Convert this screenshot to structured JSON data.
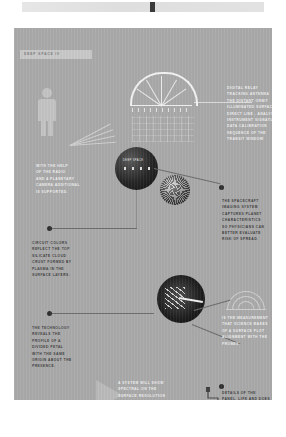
{
  "poster": {
    "background_color": "#a9a9a9",
    "header": {
      "label": "DEEP SPACE IV"
    },
    "top_strip": {
      "name": "film-strip",
      "marker_color": "#3a3a3a"
    }
  },
  "graphics": {
    "human_figure": {
      "name": "human-scale-figure"
    },
    "dome": {
      "name": "dome-arc-diagram"
    },
    "schematic": {
      "name": "grid-schematic"
    },
    "radar": {
      "name": "radar-dial-diagram"
    },
    "chevron": {
      "name": "chevron-marker"
    },
    "step_line": {
      "name": "stepped-connector-line"
    },
    "dark_bar": {
      "name": "dark-vertical-bar"
    }
  },
  "circles": [
    {
      "name": "planet-surface-photo",
      "caption": "DEEP SPACE",
      "size": "large"
    },
    {
      "name": "asteroid-photo",
      "caption": "",
      "size": "small"
    },
    {
      "name": "space-probe-photo",
      "caption": "",
      "size": "medium"
    }
  ],
  "text_blocks": {
    "right_1": {
      "name": "right-caption-one",
      "lines": [
        "DIGITAL RELAY",
        "TRACKING ANTENNA",
        "THE DISTANT ORBIT",
        "ILLUMINATED SURFACE",
        "DIRECT LINE - ANALYSIS",
        "INSTRUMENT SIGNATURE",
        "DATA CALIBRATION",
        "SEQUENCE OF THE",
        "TRANSIT WINDOW"
      ]
    },
    "right_2": {
      "name": "right-caption-two",
      "lines": [
        "THE SPACECRAFT",
        "IMAGING SYSTEM",
        "CAPTURES PLANET",
        "CHARACTERISTICS",
        "SO PHYSICIANS CAN",
        "BETTER EVALUATE",
        "RISK OF SPREAD."
      ]
    },
    "right_3": {
      "name": "right-caption-three",
      "lines": [
        "IS THE MEASUREMENT",
        "THAT SCIENCE MAKES",
        "OF A SURFACE PLOT",
        "ALIGNMENT WITH THE",
        "PROBES."
      ]
    },
    "right_4": {
      "name": "right-caption-four",
      "lines": [
        "DETAILS OF THE",
        "PANEL, LIFE AND DOES",
        "THE FILAMENTS ARE",
        "RARELY SEEN."
      ]
    },
    "left_1": {
      "name": "left-caption-one",
      "lines": [
        "WITH THE HELP",
        "OF THE RADIO",
        "AND A PLANETARY",
        "CAMERA ADDITIONAL",
        "IS SUPPORTED."
      ]
    },
    "left_2": {
      "name": "left-caption-two",
      "lines": [
        "CIRCUIT COLORS",
        "REFLECT THE TOP",
        "SILICATE CLOUD",
        "CRUST FORMED BY",
        "PLASMA IN THE",
        "SURFACE LAYERS."
      ]
    },
    "left_3": {
      "name": "left-caption-three",
      "lines": [
        "THE TECHNOLOGY",
        "REVEALS THE",
        "PROFILE OF A",
        "DIVIDED PETAL",
        "WITH THE SAME",
        "ORIGIN ABOUT THE",
        "PRESENCE."
      ]
    },
    "mid_bottom": {
      "name": "bottom-center-caption",
      "lines": [
        "A SYSTEM WILL SHOW",
        "SPECTRAL ON THE",
        "SURFACE RESOLUTION",
        "FOR EACH SCAN MADE",
        "FROM THE OBSERVATORY."
      ]
    }
  }
}
